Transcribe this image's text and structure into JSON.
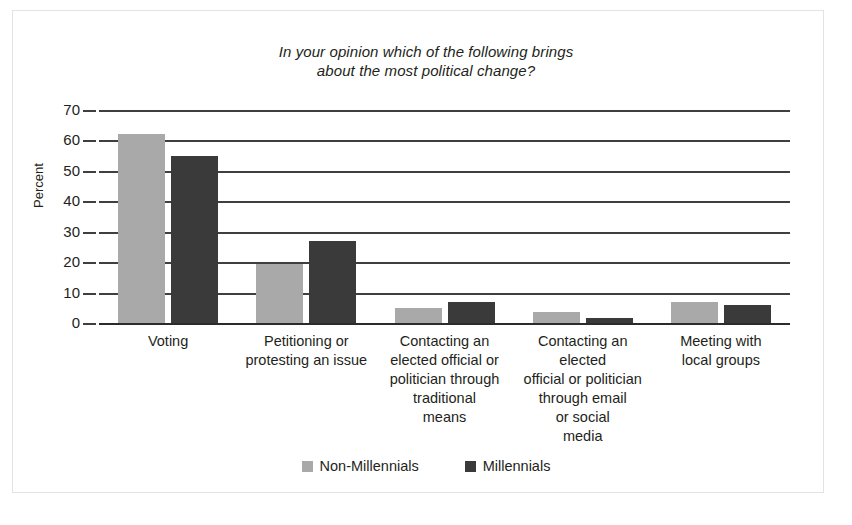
{
  "chart_data": {
    "type": "bar",
    "title": "In your opinion which of the following brings about the most political change?",
    "title_lines": [
      "In your opinion which of the following brings",
      "about the most political change?"
    ],
    "xlabel": "",
    "ylabel": "Percent",
    "ylim": [
      0,
      70
    ],
    "ytick_step": 10,
    "yticks": [
      70,
      60,
      50,
      40,
      30,
      20,
      10,
      0
    ],
    "grid": true,
    "legend_position": "bottom",
    "categories": [
      "Voting",
      "Petitioning or protesting an issue",
      "Contacting an elected official or politician through traditional means",
      "Contacting an elected official or politician through email or social media",
      "Meeting with local groups"
    ],
    "category_lines": [
      [
        "Voting"
      ],
      [
        "Petitioning or",
        "protesting an issue"
      ],
      [
        "Contacting an",
        "elected official or",
        "politician through",
        "traditional",
        "means"
      ],
      [
        "Contacting an elected",
        "official or politician",
        "through email",
        "or social",
        "media"
      ],
      [
        "Meeting with",
        "local groups"
      ]
    ],
    "series": [
      {
        "name": "Non-Millennials",
        "color": "#a9a9a9",
        "values": [
          62,
          19.5,
          5,
          3.5,
          7
        ]
      },
      {
        "name": "Millennials",
        "color": "#3a3a3a",
        "values": [
          55,
          27,
          7,
          1.8,
          6
        ]
      }
    ]
  },
  "colors": {
    "series_a": "#a9a9a9",
    "series_b": "#3a3a3a",
    "axis": "#3f3f3f",
    "text": "#231f20",
    "frame": "#e3e3e5",
    "background": "#ffffff"
  }
}
